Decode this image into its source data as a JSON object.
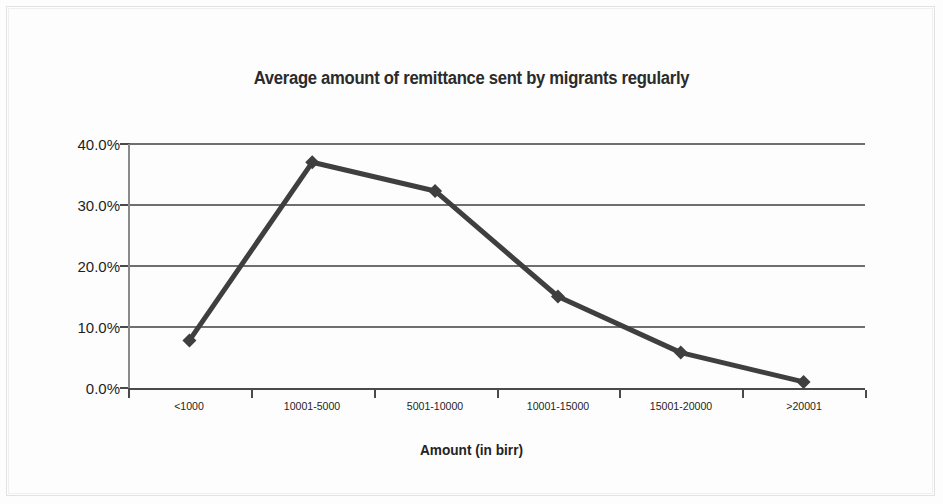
{
  "chart_data": {
    "type": "line",
    "title": "Average amount of remittance sent by migrants regularly",
    "xlabel": "Amount (in birr)",
    "ylabel": "",
    "categories": [
      "<1000",
      "10001-5000",
      "5001-10000",
      "10001-15000",
      "15001-20000",
      ">20001"
    ],
    "values": [
      7.8,
      37.0,
      32.3,
      15.0,
      5.8,
      1.0
    ],
    "ylim": [
      0,
      40
    ],
    "ytick_values": [
      0,
      10,
      20,
      30,
      40
    ],
    "ytick_labels": [
      "0.0%",
      "10.0%",
      "20.0%",
      "30.0%",
      "40.0%"
    ],
    "grid": true,
    "legend": "none",
    "marker": "diamond",
    "series_color": "#3f3f3f",
    "gridline_color": "#6f6f6f",
    "axis_color": "#4a4a4a",
    "series": [
      {
        "name": "Average amount of remittance sent by migrants regularly",
        "values": [
          7.8,
          37.0,
          32.3,
          15.0,
          5.8,
          1.0
        ]
      }
    ]
  }
}
